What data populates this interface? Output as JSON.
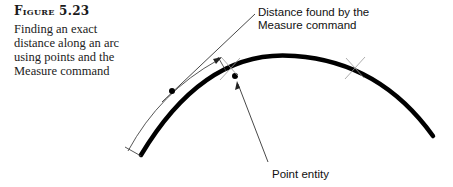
{
  "figure": {
    "label": "Figure 5.23",
    "caption": "Finding an exact distance along an arc using points and the Measure command"
  },
  "callouts": {
    "distance": {
      "line1": "Distance found by the",
      "line2": "Measure command"
    },
    "point": "Point entity"
  },
  "colors": {
    "arc": "#000000",
    "leader": "#333333",
    "cross": "#999999"
  }
}
